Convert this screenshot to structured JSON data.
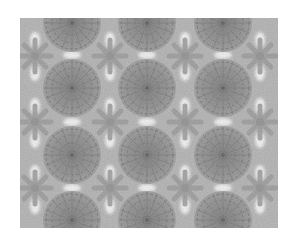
{
  "image": {
    "subject": "lace-fabric-photo",
    "description": "Grey crochet lace with large rosette medallions and small star motifs",
    "colors": {
      "background": "#ffffff",
      "lace_base": "#b4b4b4",
      "rosette": "#9a9a9a",
      "rosette_detail": "#7e7e7e",
      "holes": "#f4f4f4"
    },
    "layout": {
      "rosette_columns": [
        52,
        127,
        203
      ],
      "rosette_rows": [
        5,
        70,
        137,
        202
      ],
      "rosette_radius": 29
    }
  }
}
